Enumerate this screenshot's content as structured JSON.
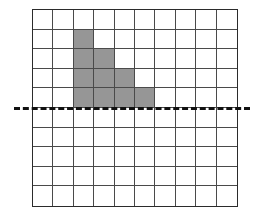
{
  "figure": {
    "grid": {
      "columns": 10,
      "rows": 10,
      "cell_line_color": "#4a4a4a",
      "border_color": "#2b2b2b",
      "cell_fill_color": "#ffffff",
      "shaded_fill_color": "#969696"
    },
    "dashed_line": {
      "name": "line-of-symmetry",
      "orientation": "horizontal",
      "color": "#111111",
      "style": "dashed",
      "thickness_px": 3,
      "below_grid_row": 5,
      "extends_outside_grid": true
    },
    "shaded_cells": [
      {
        "row": 2,
        "col": 3
      },
      {
        "row": 3,
        "col": 3
      },
      {
        "row": 3,
        "col": 4
      },
      {
        "row": 4,
        "col": 3
      },
      {
        "row": 4,
        "col": 4
      },
      {
        "row": 4,
        "col": 5
      },
      {
        "row": 5,
        "col": 3
      },
      {
        "row": 5,
        "col": 4
      },
      {
        "row": 5,
        "col": 5
      },
      {
        "row": 5,
        "col": 6
      }
    ],
    "shaded_cell_count": 10,
    "rows_per_step": [
      1,
      2,
      3,
      4
    ]
  }
}
